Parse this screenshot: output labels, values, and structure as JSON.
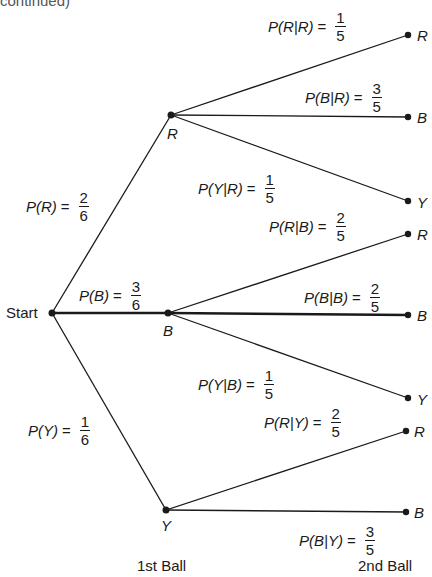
{
  "header_fragment": "continued)",
  "nodes": {
    "start": "Start",
    "first": [
      "R",
      "B",
      "Y"
    ],
    "second": [
      "R",
      "B",
      "Y",
      "R",
      "B",
      "Y",
      "R",
      "B"
    ]
  },
  "first_branches": [
    {
      "lhs": "P(R)",
      "num": "2",
      "den": "6"
    },
    {
      "lhs": "P(B)",
      "num": "3",
      "den": "6"
    },
    {
      "lhs": "P(Y)",
      "num": "1",
      "den": "6"
    }
  ],
  "second_branches": [
    {
      "lhs": "P(R|R)",
      "num": "1",
      "den": "5"
    },
    {
      "lhs": "P(B|R)",
      "num": "3",
      "den": "5"
    },
    {
      "lhs": "P(Y|R)",
      "num": "1",
      "den": "5"
    },
    {
      "lhs": "P(R|B)",
      "num": "2",
      "den": "5"
    },
    {
      "lhs": "P(B|B)",
      "num": "2",
      "den": "5"
    },
    {
      "lhs": "P(Y|B)",
      "num": "1",
      "den": "5"
    },
    {
      "lhs": "P(R|Y)",
      "num": "2",
      "den": "5"
    },
    {
      "lhs": "P(B|Y)",
      "num": "3",
      "den": "5"
    }
  ],
  "axis_labels": {
    "first": "1st Ball",
    "second": "2nd Ball"
  },
  "colors": {
    "line": "#1a1a1a",
    "background": "#ffffff"
  }
}
